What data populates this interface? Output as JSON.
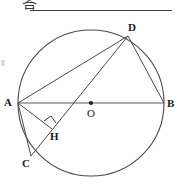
{
  "header": {
    "answer_char": "答",
    "rule_line": "horizontal-answer-line"
  },
  "figure": {
    "shape": "circle-with-inscribed-chords",
    "stroke_color": "#4a4a4a",
    "label_color": "#1a1a1a",
    "points": [
      {
        "id": "A",
        "label": "A",
        "x": 18,
        "y": 103,
        "on_circle": true,
        "note": "left endpoint of diameter AB"
      },
      {
        "id": "B",
        "label": "B",
        "x": 164,
        "y": 103,
        "on_circle": true,
        "note": "right endpoint of diameter AB"
      },
      {
        "id": "D",
        "label": "D",
        "x": 128,
        "y": 36,
        "on_circle": true,
        "note": "upper-right point on circle"
      },
      {
        "id": "C",
        "label": "C",
        "x": 31,
        "y": 156,
        "on_circle": true,
        "note": "lower-left point on circle"
      },
      {
        "id": "O",
        "label": "O",
        "x": 91,
        "y": 103,
        "on_circle": false,
        "note": "center of circle, marked with dot"
      },
      {
        "id": "H",
        "label": "H",
        "x": 50,
        "y": 126,
        "on_circle": false,
        "note": "foot of perpendicular from A to chord DC"
      }
    ],
    "circle": {
      "cx": 91,
      "cy": 103,
      "r": 73
    },
    "segments": [
      {
        "from": "A",
        "to": "B",
        "name": "diameter-AB"
      },
      {
        "from": "A",
        "to": "D",
        "name": "chord-AD"
      },
      {
        "from": "D",
        "to": "B",
        "name": "chord-DB"
      },
      {
        "from": "D",
        "to": "C",
        "name": "chord-DC"
      },
      {
        "from": "A",
        "to": "H",
        "name": "perpendicular-AH"
      },
      {
        "from": "A",
        "to": "C",
        "name": "chord-AC"
      }
    ],
    "right_angle": {
      "at": "H",
      "between": [
        "AH",
        "DC"
      ],
      "marker": "square"
    },
    "center_dot": {
      "at": "O",
      "radius": 2
    }
  }
}
